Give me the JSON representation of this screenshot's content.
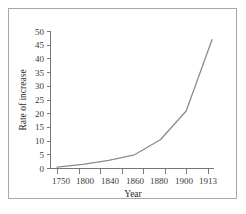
{
  "chart_data": {
    "type": "line",
    "title": "",
    "xlabel": "Year",
    "ylabel": "Rate of increase",
    "categories": [
      "1750",
      "1800",
      "1840",
      "1860",
      "1880",
      "1900",
      "1913"
    ],
    "x": [
      1750,
      1800,
      1840,
      1860,
      1880,
      1900,
      1913
    ],
    "values": [
      0.5,
      1.5,
      3,
      5,
      10.5,
      21,
      47
    ],
    "series": [
      {
        "name": "Rate of increase",
        "values": [
          0.5,
          1.5,
          3,
          5,
          10.5,
          21,
          47
        ]
      }
    ],
    "ylim": [
      0,
      50
    ],
    "ytick_labels": [
      "0",
      "5",
      "10",
      "15",
      "20",
      "25",
      "30",
      "35",
      "40",
      "45",
      "50"
    ],
    "ytick_values": [
      0,
      5,
      10,
      15,
      20,
      25,
      30,
      35,
      40,
      45,
      50
    ],
    "xtick_labels": [
      "1750",
      "1800",
      "1840",
      "1860",
      "1880",
      "1900",
      "1913"
    ],
    "grid": false,
    "legend": "none",
    "x_axis_scale": "categorical",
    "line_color": "#8c8c8c",
    "axis_color": "#777777",
    "frame_color": "#a8a8a8",
    "background_color": "#ffffff",
    "text_color": "#3a3a3a"
  },
  "figure": {
    "border_label": "chart-frame"
  }
}
